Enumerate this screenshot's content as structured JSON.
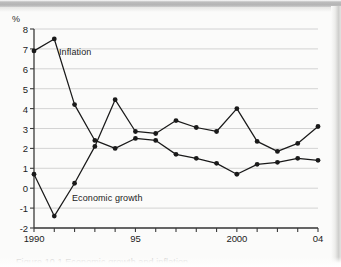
{
  "figure": {
    "axis_unit": "%",
    "caption": "Figure 10.1 Economic growth and inflation"
  },
  "chart_data": {
    "type": "line",
    "title": "",
    "subtitle": "",
    "xlabel": "",
    "ylabel": "%",
    "ylim": [
      -2,
      8
    ],
    "xlim": [
      1990,
      2004
    ],
    "grid": true,
    "legend_position": "inline-annotation",
    "y_ticks": [
      8,
      7,
      6,
      5,
      4,
      3,
      2,
      1,
      0,
      -1,
      -2
    ],
    "y_tick_labels": [
      "8",
      "7",
      "6",
      "5",
      "4",
      "3",
      "2",
      "1",
      "0",
      "-1",
      "-2"
    ],
    "x": [
      1990,
      1991,
      1992,
      1993,
      1994,
      1995,
      1996,
      1997,
      1998,
      1999,
      2000,
      2001,
      2002,
      2003,
      2004
    ],
    "x_ticks": [
      1990,
      1991,
      1992,
      1993,
      1994,
      1995,
      1996,
      1997,
      1998,
      1999,
      2000,
      2001,
      2002,
      2003,
      2004
    ],
    "x_tick_labels": [
      "1990",
      "",
      "",
      "",
      "",
      "95",
      "",
      "",
      "",
      "",
      "2000",
      "",
      "",
      "",
      "04"
    ],
    "series": [
      {
        "name": "Inflation",
        "color": "#1a1a1a",
        "marker": "circle",
        "values": [
          6.9,
          7.5,
          4.2,
          2.4,
          2.0,
          2.5,
          2.4,
          1.7,
          1.5,
          1.25,
          0.7,
          1.2,
          1.3,
          1.5,
          1.4
        ]
      },
      {
        "name": "Economic growth",
        "color": "#1a1a1a",
        "marker": "circle",
        "values": [
          0.7,
          -1.4,
          0.25,
          2.1,
          4.45,
          2.85,
          2.75,
          3.4,
          3.05,
          2.85,
          4.0,
          2.35,
          1.85,
          2.25,
          3.1
        ]
      }
    ],
    "annotations": [
      {
        "text": "Inflation",
        "x": 1991.6,
        "y": 6.3
      },
      {
        "text": "Economic growth",
        "x": 1992.3,
        "y": -0.55
      }
    ]
  }
}
